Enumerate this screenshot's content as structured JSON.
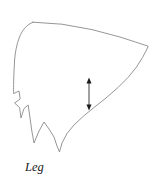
{
  "figure": {
    "caption": "Leg",
    "background_color": "#ffffff",
    "outline_color": "#8a8a8a",
    "outline_width": 0.9,
    "annotation_color": "#1a1a1a",
    "caption_position": {
      "x": 25,
      "y": 171
    },
    "outline_path": "M 33.0 22.2 C 27.0 24.5 22.5 29.5 19.5 37.0 C 16.8 44.0 15.2 52.0 14.6 60.0 C 14.0 68.0 13.8 76.5 13.6 84.5 C 13.5 88.5 13.5 91.5 13.6 93.6 L 19.0 91.0 L 20.2 99.0 L 14.6 103.0 L 19.6 107.6 L 21.0 118.0 L 24.0 108.5 L 28.2 105.0 L 30.0 118.0 L 32.0 132.0 L 34.0 143.0 L 39.0 131.0 L 44.0 122.0 L 49.0 129.0 L 54.0 137.0 L 57.0 146.0 L 59.5 152.0 L 62.0 143.0 L 67.0 133.5 L 74.0 125.0 L 83.0 116.5 L 94.0 107.5 L 106.0 98.0 L 118.0 87.5 L 128.0 77.5 L 136.5 67.0 L 142.5 57.5 L 146.5 50.0 L 148.2 46.2 L 120.0 37.0 L 92.0 29.6 L 62.0 24.2 L 33.0 22.2 Z",
    "dimension_arrow": {
      "name": "vertical-dimension-arrow",
      "x": 89.0,
      "y_top": 78.0,
      "y_bottom": 110.0,
      "double_headed": true
    }
  }
}
